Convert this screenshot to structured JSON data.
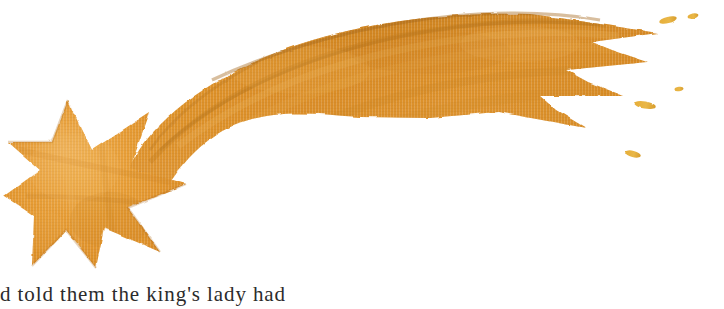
{
  "page": {
    "kind": "scanned-book-page-illustration",
    "width": 724,
    "height": 309,
    "background_color": "#ffffff"
  },
  "illustration": {
    "name": "shooting-star",
    "title": "Shooting star with comet tail",
    "medium": "watercolor painting",
    "star": {
      "points": 6,
      "center_x": 85,
      "center_y": 180,
      "outer_radius": 85,
      "inner_radius": 36
    },
    "tail": {
      "description": "curved comet trail sweeping up and to the right, splitting into three tapered prongs",
      "prongs": 3
    },
    "droplets": [
      {
        "x": 668,
        "y": 20,
        "w": 17,
        "h": 6,
        "angle": -14
      },
      {
        "x": 692,
        "y": 16,
        "w": 11,
        "h": 5,
        "angle": -12
      },
      {
        "x": 644,
        "y": 105,
        "w": 22,
        "h": 7,
        "angle": 10
      },
      {
        "x": 632,
        "y": 154,
        "w": 16,
        "h": 6,
        "angle": 14
      },
      {
        "x": 678,
        "y": 88,
        "w": 9,
        "h": 4,
        "angle": -8
      }
    ],
    "colors": {
      "base_orange": "#E59A33",
      "mid_orange": "#DE8F27",
      "deep_amber": "#C8821F",
      "dark_edge": "#A8691A",
      "light_highlight": "#F0B457",
      "droplet_gold": "#E8B43C",
      "paper_white": "#FFFFFF"
    }
  },
  "caption": {
    "text": "d told them the king's lady had",
    "note_visible_portion": "only the tops of the letters are visible; the line is cropped by the page edge"
  }
}
